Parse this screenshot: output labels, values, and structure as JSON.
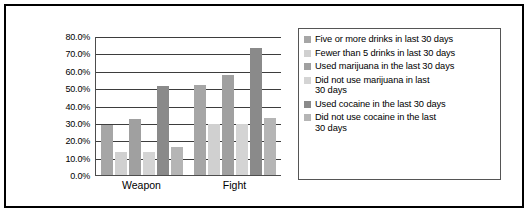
{
  "chart_data": {
    "type": "bar",
    "title": "",
    "xlabel": "",
    "ylabel": "",
    "categories": [
      "Weapon",
      "Fight"
    ],
    "ylim": [
      0,
      80
    ],
    "ytick_labels": [
      "80.0%",
      "70.0%",
      "60.0%",
      "50.0%",
      "40.0%",
      "30.0%",
      "20.0%",
      "10.0%",
      "0.0%"
    ],
    "ytick_values": [
      80,
      70,
      60,
      50,
      40,
      30,
      20,
      10,
      0
    ],
    "grid": true,
    "legend_position": "right",
    "series": [
      {
        "name": "Five or more drinks in last 30 days",
        "color": "#a6a6a6",
        "values": [
          28.5,
          52.0
        ]
      },
      {
        "name": "Fewer than 5 drinks in last 30 days",
        "color": "#d0d0d0",
        "values": [
          13.0,
          29.5
        ]
      },
      {
        "name": "Used marijuana in the last 30 days",
        "color": "#a0a0a0",
        "values": [
          32.0,
          57.5
        ]
      },
      {
        "name": "Did  not use marijuana in last 30 days",
        "color": "#d4d4d4",
        "values": [
          13.5,
          29.5
        ]
      },
      {
        "name": "Used cocaine in the last 30 days",
        "color": "#8a8a8a",
        "values": [
          51.0,
          73.0
        ]
      },
      {
        "name": "Did not use cocaine in the last 30 days",
        "color": "#b5b5b5",
        "values": [
          16.0,
          33.0
        ]
      }
    ]
  },
  "legend": {
    "items": [
      "Five or more drinks in last 30 days",
      "Fewer than 5 drinks in last 30 days",
      "Used marijuana in the last 30 days",
      "Did  not use marijuana in last\n30 days",
      "Used cocaine in the last 30 days",
      "Did not use cocaine in the last\n30 days"
    ]
  },
  "colors": {
    "frame": "#000000",
    "gridline": "#3d3d3d",
    "axis": "#4d4d4d",
    "background": "#ffffff"
  }
}
